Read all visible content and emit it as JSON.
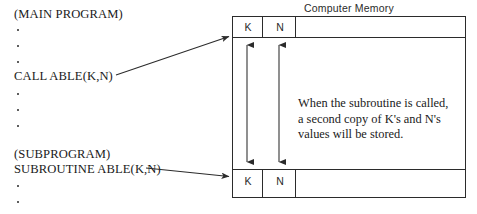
{
  "diagram": {
    "stroke_color": "#2b2b2b",
    "background": "#ffffff"
  },
  "left_program": {
    "main_header": "(MAIN PROGRAM)",
    "call_statement": "CALL ABLE(K,N)",
    "sub_header": "(SUBPROGRAM)",
    "sub_statement": "SUBROUTINE ABLE(K,N)",
    "ellipsis_dot": "•",
    "dots_after_main": 3,
    "dots_after_call": 3,
    "dots_after_sub": 2
  },
  "memory": {
    "title": "Computer Memory",
    "top_row": {
      "cells": [
        "K",
        "N",
        ""
      ]
    },
    "bottom_row": {
      "cells": [
        "K",
        "N",
        ""
      ]
    },
    "note_lines": [
      "When the subroutine is called,",
      "a second copy of K's and N's",
      "values will be stored."
    ]
  },
  "arrows": {
    "call_to_memory": "arrow-from-call-statement-to-top-memory-row",
    "subroutine_to_memory": "arrow-from-subroutine-statement-to-bottom-memory-row",
    "k_copy": "double-headed-arrow-linking-K-cells",
    "n_copy": "double-headed-arrow-linking-N-cells"
  }
}
